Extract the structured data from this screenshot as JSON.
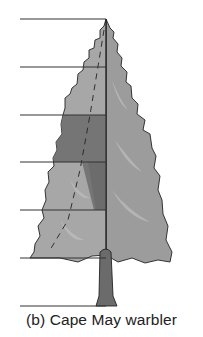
{
  "figure": {
    "caption": "(b) Cape May warbler",
    "zones": 6,
    "zone_lines_y": [
      19,
      67,
      115,
      162,
      210,
      258,
      306
    ],
    "highlighted_zones": [
      {
        "top": 115,
        "bottom": 210,
        "side": "left",
        "description": "foraging zone (dark shading)"
      }
    ],
    "colors": {
      "canopy_light": "#a9a9a9",
      "canopy_mid": "#8e8e8e",
      "canopy_dark": "#6a6a6a",
      "trunk": "#6b6b6b",
      "lines": "#333333"
    }
  }
}
